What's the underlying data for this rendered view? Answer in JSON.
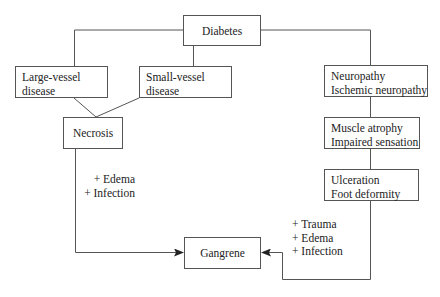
{
  "nodes": {
    "diabetes": {
      "label": "Diabetes"
    },
    "large_vessel": {
      "lines": [
        "Large-vessel",
        "disease"
      ]
    },
    "small_vessel": {
      "lines": [
        "Small-vessel",
        "disease"
      ]
    },
    "necrosis": {
      "label": "Necrosis"
    },
    "neuropathy": {
      "lines": [
        "Neuropathy",
        "Ischemic neuropathy"
      ]
    },
    "muscle_atrophy": {
      "lines": [
        "Muscle atrophy",
        "Impaired sensation"
      ]
    },
    "ulceration": {
      "lines": [
        "Ulceration",
        "Foot deformity"
      ]
    },
    "gangrene": {
      "label": "Gangrene"
    }
  },
  "annotations": {
    "left_factors": [
      "+ Edema",
      "+ Infection"
    ],
    "right_factors": [
      "+ Trauma",
      "+ Edema",
      "+ Infection"
    ]
  },
  "colors": {
    "line": "#555555",
    "text": "#222222",
    "background": "#ffffff"
  }
}
